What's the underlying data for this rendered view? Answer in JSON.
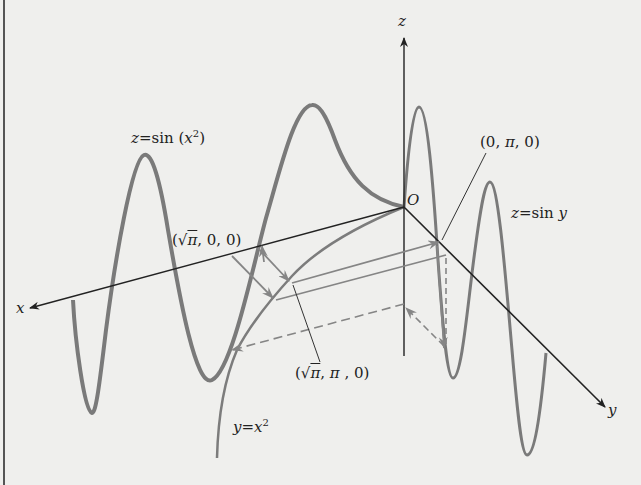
{
  "figure": {
    "type": "3d-curve-diagram",
    "axes": {
      "x_label": "x",
      "y_label": "y",
      "z_label": "z",
      "origin_label": "O"
    },
    "curves": [
      {
        "name": "z-sin-x-squared",
        "label": "z = sin (x²)",
        "label_parts": {
          "lhs": "z",
          "eq": "=",
          "fn": "sin",
          "arg_open": "(",
          "arg_var": "x",
          "arg_exp": "2",
          "arg_close": ")"
        }
      },
      {
        "name": "z-sin-y",
        "label": "z = sin y",
        "label_parts": {
          "lhs": "z",
          "eq": "=",
          "fn": "sin",
          "var": "y"
        }
      },
      {
        "name": "y-x-squared",
        "label": "y = x²",
        "label_parts": {
          "lhs": "y",
          "eq": "=",
          "var": "x",
          "exp": "2"
        }
      }
    ],
    "points": [
      {
        "name": "sqrt-pi-0-0",
        "label": "(√π, 0, 0)",
        "parts": {
          "open": "(",
          "root": "√",
          "pi": "π",
          "rest": ", 0, 0)"
        }
      },
      {
        "name": "0-pi-0",
        "label": "(0, π, 0)",
        "parts": {
          "pre": "(0, ",
          "pi": "π",
          "post": ", 0)"
        }
      },
      {
        "name": "sqrt-pi-pi-0",
        "label": "(√π, π, 0)",
        "parts": {
          "open": "(",
          "root": "√",
          "pi": "π",
          "mid": ", ",
          "pi2": "π",
          "post": " , 0)"
        }
      }
    ],
    "colors": {
      "background": "#efefed",
      "axis": "#222222",
      "curve": "#7a7a7a",
      "arrow": "#8a8a8a",
      "border": "#555555"
    }
  }
}
